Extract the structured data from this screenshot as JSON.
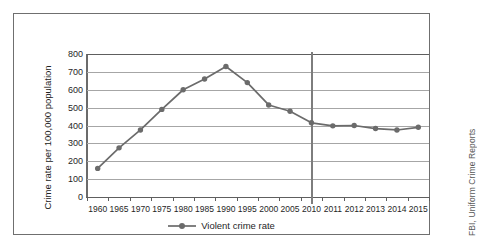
{
  "source_credit": "FBI, Uniform Crime Reports",
  "legend": {
    "label": "Violent crime rate",
    "swatch_icon": "line-marker-icon"
  },
  "colors": {
    "series": "#6b6b6b",
    "marker": "#6b6b6b",
    "gridline": "#a6a6a6",
    "axis": "#5e5e5e",
    "frame": "#6f6f6f",
    "divider": "#7d7d7d",
    "text": "#1f1f1f",
    "background": "#ffffff"
  },
  "chart_data": {
    "type": "line",
    "title": "",
    "xlabel": "",
    "ylabel": "Crime rate per 100,000 population",
    "ylim": [
      0,
      800
    ],
    "ytick_values": [
      0,
      100,
      200,
      300,
      400,
      500,
      600,
      700,
      800
    ],
    "ytick_labels": [
      "0",
      "100",
      "200",
      "300",
      "400",
      "500",
      "600",
      "700",
      "800"
    ],
    "grid": true,
    "grid_axis": "y",
    "legend_position": "bottom-center",
    "categories": [
      "1960",
      "1965",
      "1970",
      "1975",
      "1980",
      "1985",
      "1990",
      "1995",
      "2000",
      "2005",
      "2010",
      "2011",
      "2012",
      "2013",
      "2014",
      "2015"
    ],
    "series": [
      {
        "name": "Violent crime rate",
        "values": [
          160,
          275,
          375,
          490,
          600,
          660,
          730,
          640,
          515,
          480,
          415,
          398,
          400,
          383,
          375,
          390
        ]
      }
    ],
    "annotations": [
      {
        "type": "vertical-divider",
        "at_category": "2010",
        "note": "axis interval changes from 5-year to 1-year spacing"
      }
    ]
  }
}
